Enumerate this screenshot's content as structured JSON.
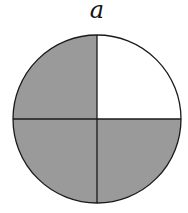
{
  "figure": {
    "label": "a",
    "shape": "circle",
    "divisions": 4,
    "shaded_parts": 3,
    "quadrants": [
      {
        "position": "top-left",
        "shaded": true
      },
      {
        "position": "top-right",
        "shaded": false
      },
      {
        "position": "bottom-left",
        "shaded": true
      },
      {
        "position": "bottom-right",
        "shaded": true
      }
    ],
    "colors": {
      "shaded": "#9a9a9a",
      "unshaded": "#ffffff",
      "stroke": "#1a1a1a"
    }
  }
}
